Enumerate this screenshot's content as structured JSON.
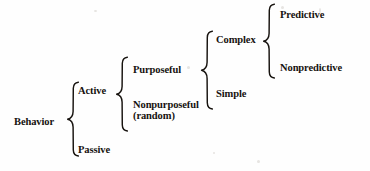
{
  "diagram": {
    "type": "bracket-taxonomy",
    "ink_color": "#17130f",
    "background_color": "#fefefe",
    "levels": 5,
    "root": {
      "label": "Behavior"
    },
    "level1": {
      "active": "Active",
      "passive": "Passive"
    },
    "level2": {
      "purposeful": "Purposeful",
      "nonpurposeful_line1": "Nonpurposeful",
      "nonpurposeful_line2": "(random)"
    },
    "level3": {
      "complex": "Complex",
      "simple": "Simple"
    },
    "level4": {
      "predictive": "Predictive",
      "nonpredictive": "Nonpredictive"
    }
  }
}
